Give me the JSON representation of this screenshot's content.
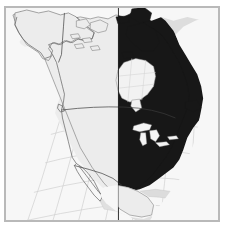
{
  "figure": {
    "width": 226,
    "height": 228,
    "background": "#ffffff",
    "title": "",
    "caption": ""
  },
  "map": {
    "name": "north-america-thematic-map",
    "projection": "lambert-conformal-conic",
    "frame": {
      "x": 4,
      "y": 6,
      "width": 216,
      "height": 216,
      "border_color": "#b9b9b9",
      "background_color": "#f7f7f7"
    },
    "colors": {
      "ocean": "#f7f7f7",
      "land_unshaded": "#ececec",
      "land_shaded": "#171717",
      "land_outside": "#dedede",
      "graticule": "#cfcfcf",
      "coastline": "#555555",
      "border": "#444444",
      "lake": "#f2f2f2",
      "divider": "#1a1a1a",
      "frame": "#b9b9b9"
    },
    "graticule": {
      "visible": true,
      "meridian_spacing_deg": 15,
      "parallel_spacing_deg": 10,
      "line_color": "#cfcfcf",
      "line_width": 0.7
    },
    "legend": {
      "visible": false,
      "entries": [
        {
          "label": "Shaded region",
          "color": "#171717"
        },
        {
          "label": "Unshaded region",
          "color": "#ececec"
        }
      ]
    },
    "features": [
      {
        "name": "alaska",
        "shaded": false
      },
      {
        "name": "canada-west",
        "shaded": false
      },
      {
        "name": "canada-east",
        "shaded": true
      },
      {
        "name": "united-states-west",
        "shaded": false
      },
      {
        "name": "united-states-east",
        "shaded": true
      },
      {
        "name": "mexico",
        "shaded": false
      },
      {
        "name": "greenland",
        "shaded": false
      },
      {
        "name": "central-america",
        "shaded": false
      },
      {
        "name": "caribbean-islands",
        "shaded": false
      },
      {
        "name": "hudson-bay",
        "shaded": false
      },
      {
        "name": "great-lakes",
        "shaded": false
      }
    ],
    "divider": {
      "name": "shading-boundary-meridian",
      "visible": true,
      "x_fraction": 0.53,
      "orientation": "vertical"
    },
    "annotations": [],
    "tick_labels": {
      "top": [],
      "left": [],
      "bottom": [],
      "right": []
    }
  },
  "chart_data": {
    "type": "map",
    "title": "",
    "xlabel": "",
    "ylabel": "",
    "categories": [
      "unshaded",
      "shaded"
    ],
    "values": [
      1,
      1
    ],
    "series": [
      {
        "name": "shaded-region",
        "color": "#171717",
        "regions": [
          "canada-east",
          "united-states-east"
        ]
      },
      {
        "name": "unshaded-region",
        "color": "#ececec",
        "regions": [
          "alaska",
          "canada-west",
          "united-states-west",
          "mexico",
          "greenland",
          "central-america"
        ]
      }
    ],
    "grid": true,
    "legend_position": "none"
  }
}
